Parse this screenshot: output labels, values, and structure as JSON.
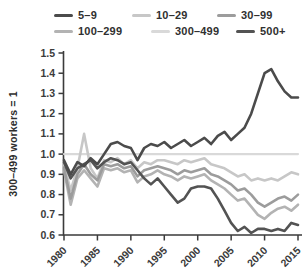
{
  "chart_data": {
    "type": "line",
    "title": "",
    "xlabel": "",
    "ylabel": "300–499 workers = 1",
    "grid": false,
    "legend_position": "top",
    "axis_color": "#3b3b3b",
    "xlim": [
      1980,
      2015
    ],
    "ylim": [
      0.6,
      1.5
    ],
    "x_ticks": [
      1980,
      1985,
      1990,
      1995,
      2000,
      2005,
      2010,
      2015
    ],
    "y_ticks": [
      1.5,
      1.4,
      1.3,
      1.2,
      1.1,
      1.0,
      0.9,
      0.8,
      0.7,
      0.6
    ],
    "x": [
      1980,
      1981,
      1982,
      1983,
      1984,
      1985,
      1986,
      1987,
      1988,
      1989,
      1990,
      1991,
      1992,
      1993,
      1994,
      1995,
      1996,
      1997,
      1998,
      1999,
      2000,
      2001,
      2002,
      2003,
      2004,
      2005,
      2006,
      2007,
      2008,
      2009,
      2010,
      2011,
      2012,
      2013,
      2014,
      2015
    ],
    "draw_order": [
      4,
      1,
      3,
      2,
      5,
      0
    ],
    "series": [
      {
        "name": "5–9",
        "color": "#4b4b4b",
        "width": 2.6,
        "values": [
          0.97,
          0.9,
          0.96,
          0.94,
          0.98,
          0.95,
          1.0,
          1.05,
          1.06,
          1.04,
          1.03,
          0.97,
          1.03,
          1.05,
          1.04,
          1.06,
          1.03,
          1.05,
          1.07,
          1.04,
          1.06,
          1.08,
          1.05,
          1.09,
          1.11,
          1.07,
          1.1,
          1.13,
          1.2,
          1.3,
          1.4,
          1.42,
          1.36,
          1.31,
          1.28,
          1.28
        ]
      },
      {
        "name": "10–29",
        "color": "#c7c7c7",
        "width": 2.6,
        "values": [
          0.95,
          0.82,
          0.93,
          1.1,
          0.93,
          0.88,
          0.97,
          0.96,
          0.98,
          0.95,
          0.97,
          0.93,
          0.96,
          0.95,
          0.97,
          0.97,
          0.96,
          0.95,
          0.97,
          0.96,
          0.97,
          0.98,
          0.95,
          0.94,
          0.93,
          0.91,
          0.89,
          0.9,
          0.87,
          0.88,
          0.87,
          0.88,
          0.87,
          0.89,
          0.91,
          0.9
        ]
      },
      {
        "name": "30–99",
        "color": "#9c9c9c",
        "width": 2.6,
        "values": [
          0.93,
          0.78,
          0.9,
          0.95,
          0.9,
          0.87,
          0.95,
          0.94,
          0.95,
          0.93,
          0.94,
          0.89,
          0.92,
          0.93,
          0.94,
          0.93,
          0.92,
          0.9,
          0.92,
          0.91,
          0.92,
          0.93,
          0.9,
          0.89,
          0.87,
          0.85,
          0.82,
          0.83,
          0.8,
          0.76,
          0.74,
          0.76,
          0.78,
          0.79,
          0.77,
          0.8
        ]
      },
      {
        "name": "100–299",
        "color": "#b3b3b3",
        "width": 2.6,
        "values": [
          0.92,
          0.75,
          0.88,
          0.92,
          0.88,
          0.84,
          0.93,
          0.92,
          0.93,
          0.91,
          0.92,
          0.86,
          0.89,
          0.9,
          0.92,
          0.9,
          0.89,
          0.87,
          0.89,
          0.88,
          0.89,
          0.9,
          0.87,
          0.85,
          0.83,
          0.8,
          0.77,
          0.78,
          0.74,
          0.7,
          0.68,
          0.71,
          0.73,
          0.74,
          0.72,
          0.75
        ]
      },
      {
        "name": "300–499",
        "color": "#d9d9d9",
        "width": 2.2,
        "values": [
          1.0,
          1.0,
          1.0,
          1.0,
          1.0,
          1.0,
          1.0,
          1.0,
          1.0,
          1.0,
          1.0,
          1.0,
          1.0,
          1.0,
          1.0,
          1.0,
          1.0,
          1.0,
          1.0,
          1.0,
          1.0,
          1.0,
          1.0,
          1.0,
          1.0,
          1.0,
          1.0,
          1.0,
          1.0,
          1.0,
          1.0,
          1.0,
          1.0,
          1.0,
          1.0,
          1.0
        ]
      },
      {
        "name": "500+",
        "color": "#535353",
        "width": 2.6,
        "values": [
          0.96,
          0.88,
          0.93,
          0.95,
          0.97,
          0.93,
          0.96,
          0.98,
          0.97,
          0.95,
          0.96,
          0.92,
          0.88,
          0.85,
          0.88,
          0.84,
          0.8,
          0.76,
          0.78,
          0.83,
          0.84,
          0.84,
          0.83,
          0.78,
          0.72,
          0.66,
          0.62,
          0.64,
          0.61,
          0.63,
          0.63,
          0.62,
          0.63,
          0.62,
          0.66,
          0.65
        ]
      }
    ]
  },
  "legend_layout": [
    {
      "series": 0,
      "left": 54,
      "top": 9
    },
    {
      "series": 1,
      "left": 132,
      "top": 9
    },
    {
      "series": 2,
      "left": 217,
      "top": 9
    },
    {
      "series": 3,
      "left": 54,
      "top": 25
    },
    {
      "series": 4,
      "left": 151,
      "top": 25
    },
    {
      "series": 5,
      "left": 236,
      "top": 25
    }
  ]
}
